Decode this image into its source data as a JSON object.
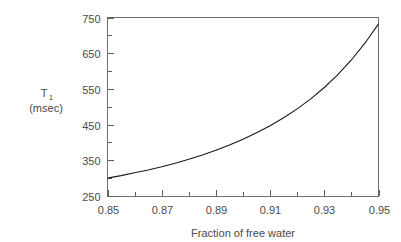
{
  "chart_data": {
    "type": "line",
    "title": "",
    "subtitle": "",
    "xlabel": "Fraction of free water",
    "ylabel_line1": "T",
    "ylabel_sub": "1",
    "ylabel_line2": "(msec)",
    "xlim": [
      0.85,
      0.95
    ],
    "ylim": [
      250,
      750
    ],
    "grid": false,
    "legend": false,
    "x_major_ticks": [
      0.85,
      0.87,
      0.89,
      0.91,
      0.93,
      0.95
    ],
    "x_tick_labels": [
      "0.85",
      "0.87",
      "0.89",
      "0.91",
      "0.93",
      "0.95"
    ],
    "x_minor_ticks": [
      0.86,
      0.88,
      0.9,
      0.92,
      0.94
    ],
    "y_major_ticks": [
      250,
      350,
      450,
      550,
      650,
      750
    ],
    "y_tick_labels": [
      "250",
      "350",
      "450",
      "550",
      "650",
      "750"
    ],
    "y_minor_ticks": [
      300,
      400,
      500,
      600,
      700
    ],
    "series": [
      {
        "name": "T1 vs fraction of free water",
        "x": [
          0.85,
          0.855,
          0.86,
          0.865,
          0.87,
          0.875,
          0.88,
          0.885,
          0.89,
          0.895,
          0.9,
          0.905,
          0.91,
          0.915,
          0.92,
          0.925,
          0.93,
          0.935,
          0.94,
          0.945,
          0.95
        ],
        "values": [
          300,
          307,
          315,
          323,
          332,
          342,
          353,
          365,
          378,
          393,
          409,
          427,
          447,
          469,
          494,
          522,
          554,
          590,
          631,
          678,
          732
        ]
      }
    ]
  },
  "axis_labels": {
    "y_label_main": "T",
    "y_label_subscript": "1",
    "y_label_units": "(msec)",
    "x_label": "Fraction of free water"
  },
  "colors": {
    "background": "#ffffff",
    "curve": "#1a1a1a",
    "frame": "#6e6e6e",
    "text": "#4a4a4a"
  }
}
